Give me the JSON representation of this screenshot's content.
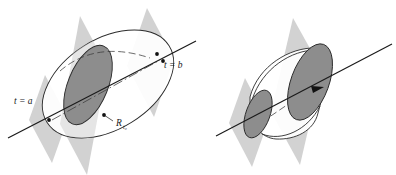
{
  "figure": {
    "caption": "",
    "background_color": "#ffffff",
    "width": 396,
    "height": 175,
    "colors": {
      "plane_fill": "#d2d2d2",
      "disk_fill": "#8d8d8d",
      "outline": "#2b2b2b",
      "axis_line": "#1a1a1a",
      "dashed_line": "#3a3a3a",
      "background": "#ffffff"
    }
  },
  "panels": [
    {
      "id": "left-panel",
      "name": "ellipsoid-with-cross-section",
      "description": "Ellipsoidal solid pierced by an axis line, cut by three parallel planes, with one shaded elliptical cross-section disk.",
      "planes": 3,
      "shaded_disks": 1,
      "labels": [
        {
          "id": "label-t-a",
          "name": "label-t-equals-a",
          "text": "t = a",
          "base": "t = a",
          "subscript": "",
          "x": 14,
          "y": 104
        },
        {
          "id": "label-t-b",
          "name": "label-t-equals-b",
          "text": "t = b",
          "base": "t = b",
          "subscript": "",
          "x": 164,
          "y": 68
        },
        {
          "id": "label-R-t0",
          "name": "label-region-r-sub-t0",
          "text": "R",
          "base": "R",
          "subscript": "t₀",
          "x": 116,
          "y": 126
        }
      ],
      "points": [
        {
          "id": "point-t-a",
          "name": "point-at-t-equals-a",
          "x": 49,
          "y": 120
        },
        {
          "id": "point-t-b",
          "name": "point-at-t-equals-b",
          "x": 163,
          "y": 61
        },
        {
          "id": "point-t-b-upper",
          "name": "point-on-upper-curve",
          "x": 157,
          "y": 54
        },
        {
          "id": "point-R-t0",
          "name": "point-on-cross-section",
          "x": 104,
          "y": 115
        }
      ]
    },
    {
      "id": "right-panel",
      "name": "frustum-with-two-cross-sections",
      "description": "Conical frustum solid pierced by an axis line, cut by two parallel planes, with shaded elliptical disks at both ends and a direction arrow on the axis.",
      "planes": 2,
      "shaded_disks": 2,
      "labels": [],
      "points": [
        {
          "id": "arrow-tip",
          "name": "axis-direction-arrowhead",
          "x": 323,
          "y": 88
        }
      ]
    }
  ]
}
